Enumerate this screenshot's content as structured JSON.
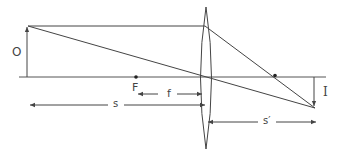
{
  "diagram": {
    "colors": {
      "line": "#444444",
      "background": "#ffffff"
    },
    "labels": {
      "object": "O",
      "focal_point": "F",
      "focal_length": "f",
      "object_distance": "s",
      "image_distance": "s′",
      "image": "I"
    }
  }
}
